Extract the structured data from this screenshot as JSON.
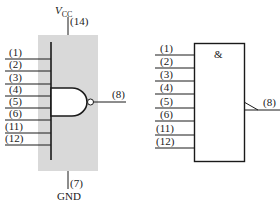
{
  "diagram": {
    "colors": {
      "package_fill": "#d9d9d9",
      "line": "#1a1a1a",
      "background": "#ffffff"
    },
    "left_symbol": {
      "power": {
        "label_main": "V",
        "label_sub": "CC",
        "pin": "(14)"
      },
      "ground": {
        "label": "GND",
        "pin": "(7)"
      },
      "inputs": [
        "(1)",
        "(2)",
        "(3)",
        "(4)",
        "(5)",
        "(6)",
        "(11)",
        "(12)"
      ],
      "output": "(8)",
      "gate_type": "NAND"
    },
    "right_symbol": {
      "qualifier": "&",
      "inputs": [
        "(1)",
        "(2)",
        "(3)",
        "(4)",
        "(5)",
        "(6)",
        "(11)",
        "(12)"
      ],
      "output": "(8)",
      "output_indicator": "negation (polarity) slash"
    }
  }
}
